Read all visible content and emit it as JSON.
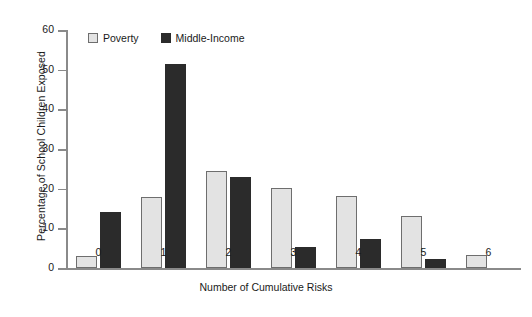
{
  "chart_data": {
    "type": "bar",
    "title": "",
    "xlabel": "Number of Cumulative Risks",
    "ylabel": "Percentage of School Children Exposed",
    "categories": [
      "0",
      "1",
      "2",
      "3",
      "4",
      "5",
      "6"
    ],
    "series": [
      {
        "name": "Poverty",
        "color": "#e3e3e3",
        "values": [
          3.0,
          17.8,
          24.5,
          20.2,
          18.2,
          13.1,
          3.2
        ]
      },
      {
        "name": "Middle-Income",
        "color": "#2b2b2b",
        "values": [
          14.1,
          51.5,
          22.9,
          5.2,
          7.2,
          2.3,
          0
        ]
      }
    ],
    "ylim": [
      0,
      60
    ],
    "yticks": [
      "0",
      "10",
      "20",
      "30",
      "40",
      "50",
      "60"
    ],
    "grid": false,
    "legend_position": "top-left"
  },
  "legend": {
    "items": [
      {
        "label": "Poverty",
        "swatch": "light-square-swatch"
      },
      {
        "label": "Middle-Income",
        "swatch": "dark-square-swatch"
      }
    ]
  }
}
